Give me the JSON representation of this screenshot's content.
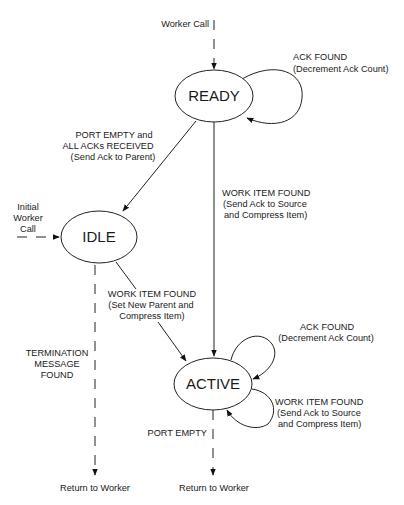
{
  "states": {
    "ready": {
      "label": "READY"
    },
    "idle": {
      "label": "IDLE"
    },
    "active": {
      "label": "ACTIVE"
    }
  },
  "entries": {
    "worker_call": "Worker Call",
    "initial_worker_call": [
      "Initial",
      "Worker",
      "Call"
    ]
  },
  "transitions": {
    "ready_self_ack": [
      "ACK FOUND",
      "(Decrement Ack Count)"
    ],
    "ready_to_idle": [
      "PORT EMPTY and",
      "ALL ACKs RECEIVED",
      "(Send Ack to Parent)"
    ],
    "ready_to_active": [
      "WORK ITEM FOUND",
      "(Send Ack to Source",
      "and Compress Item)"
    ],
    "idle_to_active": [
      "WORK ITEM FOUND",
      "(Set New Parent and",
      "Compress Item)"
    ],
    "idle_exit": [
      "TERMINATION",
      "MESSAGE",
      "FOUND"
    ],
    "active_self_ack": [
      "ACK FOUND",
      "(Decrement Ack Count)"
    ],
    "active_self_work": [
      "WORK ITEM FOUND",
      "(Send Ack to Source",
      "and Compress Item)"
    ],
    "active_exit": "PORT EMPTY"
  },
  "exits": {
    "left": "Return to Worker",
    "right": "Return to Worker"
  }
}
